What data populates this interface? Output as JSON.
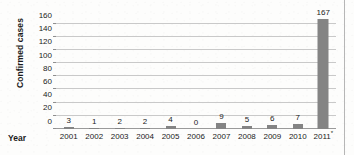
{
  "figure": {
    "background_color": "#fdfdfc",
    "bar_color": "#848484",
    "gridline_color": "#c9c9c9",
    "axis_color": "#9a9a9a",
    "text_color": "#1b1b1b"
  },
  "chart_data": {
    "type": "bar",
    "title": "",
    "subtitle": "",
    "xlabel": "Year",
    "ylabel": "Confirmed cases",
    "categories": [
      "2001",
      "2002",
      "2003",
      "2004",
      "2005",
      "2006",
      "2007",
      "2008",
      "2009",
      "2010",
      "2011"
    ],
    "category_labels": [
      "2001",
      "2002",
      "2003",
      "2004",
      "2005",
      "2006",
      "2007",
      "2008",
      "2009",
      "2010",
      "2011*"
    ],
    "category_footnote_marker": "*",
    "category_footnote_index": 10,
    "values": [
      3,
      1,
      2,
      2,
      4,
      0,
      9,
      5,
      6,
      7,
      167
    ],
    "data_labels": [
      "3",
      "1",
      "2",
      "2",
      "4",
      "0",
      "9",
      "5",
      "6",
      "7",
      "167"
    ],
    "data_labels_shown": true,
    "ylim": [
      0,
      170
    ],
    "yticks": [
      0,
      20,
      40,
      60,
      80,
      100,
      120,
      140,
      160
    ],
    "ytick_labels": [
      "0",
      "20",
      "40",
      "60",
      "80",
      "100",
      "120",
      "140",
      "160"
    ],
    "ytick_step": 20,
    "grid": "horizontal",
    "legend": "none",
    "series": [
      {
        "name": "Confirmed cases",
        "values": [
          3,
          1,
          2,
          2,
          4,
          0,
          9,
          5,
          6,
          7,
          167
        ]
      }
    ]
  }
}
